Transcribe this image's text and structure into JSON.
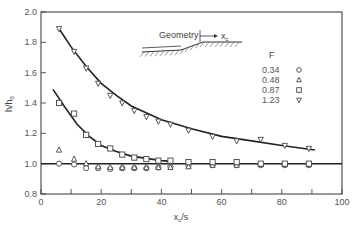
{
  "chart_data": {
    "type": "scatter",
    "title": "",
    "xlabel": "x_c/s",
    "ylabel": "h/h_0",
    "xlim": [
      0,
      100
    ],
    "ylim": [
      0.8,
      2.0
    ],
    "x_ticks": [
      "0",
      "20",
      "40",
      "60",
      "80",
      "100"
    ],
    "y_ticks": [
      "0.8",
      "1.0",
      "1.2",
      "1.4",
      "1.6",
      "1.8",
      "2.0"
    ],
    "grid": false,
    "legend": {
      "title": "F",
      "position": "upper right",
      "entries": [
        {
          "label": "0.34",
          "marker": "circle"
        },
        {
          "label": "0.48",
          "marker": "triangle-up"
        },
        {
          "label": "0.87",
          "marker": "square"
        },
        {
          "label": "1.23",
          "marker": "triangle-down"
        }
      ]
    },
    "annotation": {
      "label": "Geometry",
      "arrow_label": "x_c"
    },
    "series": [
      {
        "name": "0.34",
        "marker": "circle",
        "x": [
          6,
          11,
          15,
          19,
          23,
          27,
          31,
          35,
          39,
          43,
          49,
          57,
          65,
          73,
          81,
          89
        ],
        "y": [
          1.0,
          0.995,
          0.97,
          0.97,
          0.965,
          0.97,
          0.97,
          0.97,
          0.975,
          0.98,
          0.985,
          0.99,
          0.99,
          0.99,
          0.99,
          0.99
        ]
      },
      {
        "name": "0.48",
        "marker": "triangle-up",
        "x": [
          6,
          11,
          15,
          19,
          23,
          27,
          31,
          35,
          39,
          43,
          49,
          57,
          65,
          73,
          81,
          89
        ],
        "y": [
          1.09,
          1.03,
          1.0,
          0.98,
          0.975,
          0.975,
          0.975,
          0.975,
          0.975,
          0.975,
          0.98,
          0.99,
          0.99,
          0.995,
          0.995,
          0.995
        ]
      },
      {
        "name": "0.87",
        "marker": "square",
        "x": [
          6,
          11,
          15,
          19,
          23,
          27,
          31,
          35,
          39,
          43,
          49,
          57,
          65,
          73,
          81,
          89
        ],
        "y": [
          1.4,
          1.33,
          1.19,
          1.13,
          1.1,
          1.06,
          1.04,
          1.03,
          1.02,
          1.02,
          1.01,
          1.01,
          1.01,
          1.0,
          1.0,
          1.0
        ]
      },
      {
        "name": "1.23",
        "marker": "triangle-down",
        "x": [
          6,
          11,
          15,
          19,
          23,
          27,
          31,
          35,
          39,
          43,
          49,
          57,
          65,
          73,
          81,
          89
        ],
        "y": [
          1.89,
          1.74,
          1.63,
          1.53,
          1.45,
          1.4,
          1.35,
          1.31,
          1.28,
          1.26,
          1.22,
          1.18,
          1.15,
          1.16,
          1.12,
          1.1
        ]
      }
    ],
    "fit_curves": [
      {
        "name": "1.23 fit",
        "x": [
          6,
          10,
          15,
          20,
          25,
          30,
          40,
          50,
          60,
          70,
          80,
          91
        ],
        "y": [
          1.89,
          1.77,
          1.64,
          1.53,
          1.45,
          1.38,
          1.29,
          1.23,
          1.18,
          1.15,
          1.12,
          1.09
        ]
      },
      {
        "name": "0.87 fit",
        "x": [
          4,
          8,
          12,
          16,
          20,
          25,
          30,
          35,
          40,
          43
        ],
        "y": [
          1.49,
          1.37,
          1.26,
          1.18,
          1.12,
          1.08,
          1.05,
          1.035,
          1.02,
          1.015
        ]
      },
      {
        "name": "baseline",
        "x": [
          0,
          100
        ],
        "y": [
          1.0,
          1.0
        ]
      }
    ]
  }
}
